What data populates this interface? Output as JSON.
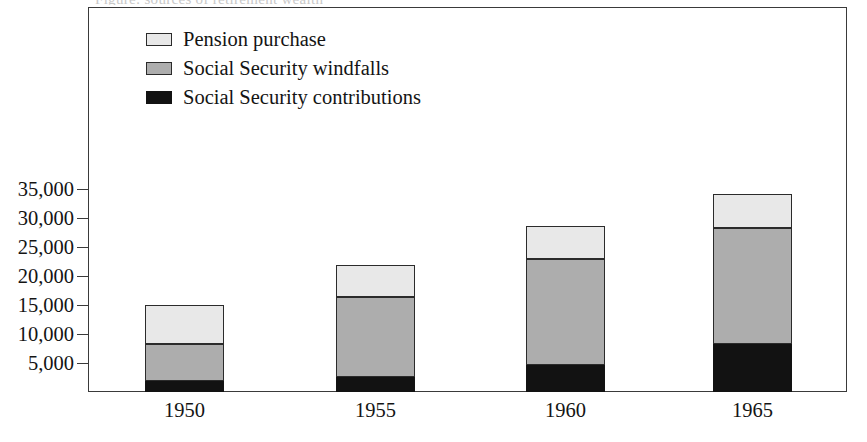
{
  "figure": {
    "clipped_header_text": "Figure: sources of retirement wealth",
    "background_color": "#ffffff",
    "frame_color": "#3a3a3a"
  },
  "legend": {
    "position": "top-left-inside",
    "items": [
      {
        "label": "Pension purchase",
        "color": "#e8e8e8",
        "key": "pension"
      },
      {
        "label": "Social Security windfalls",
        "color": "#adadad",
        "key": "windfalls"
      },
      {
        "label": "Social Security contributions",
        "color": "#121212",
        "key": "contrib"
      }
    ]
  },
  "chart_data": {
    "type": "bar",
    "stacked": true,
    "title": "",
    "xlabel": "",
    "ylabel": "",
    "categories": [
      "1950",
      "1955",
      "1960",
      "1965"
    ],
    "ylim": [
      0,
      37500
    ],
    "yticks": [
      5000,
      10000,
      15000,
      20000,
      25000,
      30000,
      35000
    ],
    "ytick_labels": [
      "5,000",
      "10,000",
      "15,000",
      "20,000",
      "25,000",
      "30,000",
      "35,000"
    ],
    "grid": false,
    "series": [
      {
        "name": "Social Security contributions",
        "color": "#121212",
        "values": [
          1900,
          2600,
          4650,
          8250
        ]
      },
      {
        "name": "Social Security windfalls",
        "color": "#adadad",
        "values": [
          8200,
          16300,
          23000,
          28200
        ]
      },
      {
        "name": "Pension purchase",
        "color": "#e8e8e8",
        "values": [
          14950,
          21900,
          28600,
          34100
        ]
      }
    ],
    "stack_order_bottom_to_top": [
      "Social Security contributions",
      "Social Security windfalls",
      "Pension purchase"
    ],
    "cumulative_tops": [
      {
        "category": "1950",
        "contrib_top": 1900,
        "windfalls_top": 8200,
        "pension_top": 14950
      },
      {
        "category": "1955",
        "contrib_top": 2600,
        "windfalls_top": 16300,
        "pension_top": 21900
      },
      {
        "category": "1960",
        "contrib_top": 4650,
        "windfalls_top": 23000,
        "pension_top": 28600
      },
      {
        "category": "1965",
        "contrib_top": 8250,
        "windfalls_top": 28200,
        "pension_top": 34100
      }
    ]
  },
  "geometry": {
    "plot_left": 88,
    "plot_top": 7,
    "plot_width": 759,
    "plot_height": 385,
    "baseline_y": 392,
    "px_per_unit": 0.0058,
    "bar_width": 79,
    "bar_lefts": [
      145,
      336,
      526,
      713
    ]
  }
}
